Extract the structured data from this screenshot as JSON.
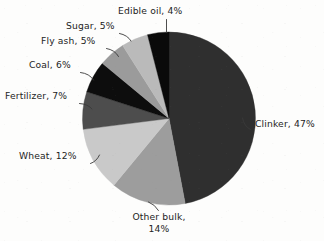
{
  "chart_data": {
    "type": "pie",
    "title": "",
    "subtitle": "",
    "xlabel": "",
    "ylabel": "",
    "legend_position": "callout-labels",
    "grid": false,
    "units": "percent",
    "total": 100,
    "start_angle_deg": 0,
    "direction": "clockwise",
    "categories": [
      "Clinker",
      "Other bulk",
      "Wheat",
      "Fertilizer",
      "Coal",
      "Fly ash",
      "Sugar",
      "Edible oil"
    ],
    "values": [
      47,
      14,
      12,
      7,
      6,
      5,
      5,
      4
    ],
    "slices": [
      {
        "name": "Clinker",
        "value": 47,
        "label": "Clinker, 47%",
        "color": "#2f2f2f",
        "label_lines": [
          "Clinker, 47%"
        ]
      },
      {
        "name": "Other bulk",
        "value": 14,
        "label": "Other bulk, 14%",
        "color": "#9d9d9d",
        "label_lines": [
          "Other bulk,",
          "14%"
        ]
      },
      {
        "name": "Wheat",
        "value": 12,
        "label": "Wheat, 12%",
        "color": "#c9c9c9",
        "label_lines": [
          "Wheat, 12%"
        ]
      },
      {
        "name": "Fertilizer",
        "value": 7,
        "label": "Fertilizer, 7%",
        "color": "#4d4d4d",
        "label_lines": [
          "Fertilizer, 7%"
        ]
      },
      {
        "name": "Coal",
        "value": 6,
        "label": "Coal, 6%",
        "color": "#0d0d0d",
        "label_lines": [
          "Coal, 6%"
        ]
      },
      {
        "name": "Fly ash",
        "value": 5,
        "label": "Fly ash, 5%",
        "color": "#9b9b9b",
        "label_lines": [
          "Fly ash, 5%"
        ]
      },
      {
        "name": "Sugar",
        "value": 5,
        "label": "Sugar, 5%",
        "color": "#bababa",
        "label_lines": [
          "Sugar, 5%"
        ]
      },
      {
        "name": "Edible oil",
        "value": 4,
        "label": "Edible oil, 4%",
        "color": "#0a0a0a",
        "label_lines": [
          "Edible oil, 4%"
        ]
      }
    ]
  },
  "labels": {
    "edible_oil": "Edible oil, 4%",
    "sugar": "Sugar, 5%",
    "fly_ash": "Fly ash, 5%",
    "coal": "Coal, 6%",
    "fertilizer": "Fertilizer, 7%",
    "wheat": "Wheat, 12%",
    "other_bulk_line1": "Other bulk,",
    "other_bulk_line2": "14%",
    "clinker": "Clinker, 47%"
  },
  "colors": {
    "background": "#fdfdfc",
    "text": "#242424",
    "leader_line": "#3a3a3a",
    "clinker": "#2f2f2f",
    "other_bulk": "#9d9d9d",
    "wheat": "#c9c9c9",
    "fertilizer": "#4d4d4d",
    "coal": "#0d0d0d",
    "fly_ash": "#9b9b9b",
    "sugar": "#bababa",
    "edible_oil": "#0a0a0a"
  }
}
